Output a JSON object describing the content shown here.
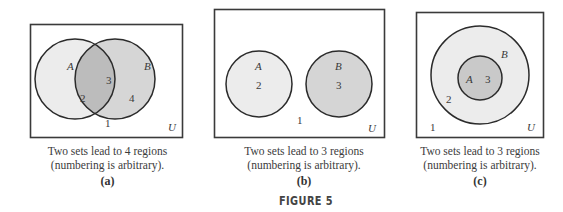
{
  "figure": {
    "title": "FIGURE 5"
  },
  "panels": [
    {
      "id": "a",
      "sublabel": "(a)",
      "caption_line1": "Two sets lead to 4 regions",
      "caption_line2": "(numbering is arbitrary).",
      "universe_label": "U",
      "set_labels": {
        "A": "A",
        "B": "B"
      },
      "region_numbers": {
        "outside": "1",
        "A_only": "2",
        "A_and_B": "3",
        "B_only": "4"
      },
      "relationship": "overlapping"
    },
    {
      "id": "b",
      "sublabel": "(b)",
      "caption_line1": "Two sets lead to 3 regions",
      "caption_line2": "(numbering is arbitrary).",
      "universe_label": "U",
      "set_labels": {
        "A": "A",
        "B": "B"
      },
      "region_numbers": {
        "outside": "1",
        "A": "2",
        "B": "3"
      },
      "relationship": "disjoint"
    },
    {
      "id": "c",
      "sublabel": "(c)",
      "caption_line1": "Two sets lead to 3 regions",
      "caption_line2": "(numbering is arbitrary).",
      "universe_label": "U",
      "set_labels": {
        "A": "A",
        "B": "B"
      },
      "region_numbers": {
        "outside": "1",
        "B_only": "2",
        "A": "3"
      },
      "relationship": "A subset of B"
    }
  ],
  "colors": {
    "outline": "#2b2b2b",
    "light_fill": "#ececec",
    "medium_fill": "#d5d5d5",
    "dark_fill": "#bcbcbc",
    "text": "#3a3a3a"
  }
}
